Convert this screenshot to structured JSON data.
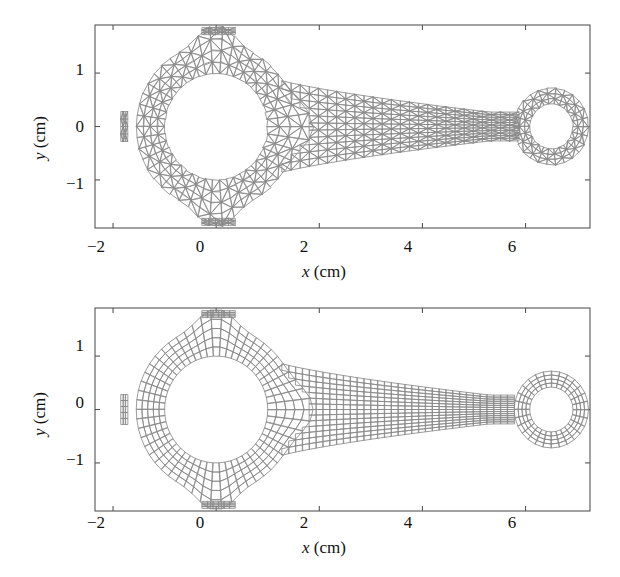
{
  "figure": {
    "background": "#ffffff",
    "mesh_color": "#8a8a8a",
    "axis_color": "#555555",
    "text_color": "#111111"
  },
  "chart_data": {
    "type": "diagram",
    "title": "",
    "panels": [
      {
        "id": "top",
        "mesh_type": "triangular",
        "xlabel": "x (cm)",
        "ylabel": "y (cm)",
        "xticks": [
          -2,
          0,
          2,
          4,
          6
        ],
        "xticklabels": [
          "−2",
          "0",
          "2",
          "4",
          "6"
        ],
        "yticks": [
          -1,
          0,
          1
        ],
        "yticklabels": [
          "−1",
          "0",
          "1"
        ],
        "xlim": [
          -2.35,
          7.25
        ],
        "ylim": [
          -1.9,
          1.9
        ],
        "grid": false,
        "box": true,
        "tick_direction": "in"
      },
      {
        "id": "bottom",
        "mesh_type": "quadrilateral",
        "xlabel": "x (cm)",
        "ylabel": "y (cm)",
        "xticks": [
          -2,
          0,
          2,
          4,
          6
        ],
        "xticklabels": [
          "−2",
          "0",
          "2",
          "4",
          "6"
        ],
        "yticks": [
          -1,
          0,
          1
        ],
        "yticklabels": [
          "−1",
          "0",
          "1"
        ],
        "xlim": [
          -2.35,
          7.25
        ],
        "ylim": [
          -1.9,
          1.9
        ],
        "grid": false,
        "box": true,
        "tick_direction": "in"
      }
    ],
    "geometry": {
      "big_end": {
        "center_x": 0.0,
        "center_y": 0.0,
        "inner_radius": 1.0,
        "outer_radius": 1.55
      },
      "small_end": {
        "center_x": 6.5,
        "center_y": 0.0,
        "inner_radius": 0.42,
        "outer_radius": 0.72
      },
      "shank_half_width_at_big_end": 0.95,
      "shank_half_width_at_small_end": 0.27,
      "tabs": [
        {
          "side": "top",
          "x_center": 0.05,
          "half_width": 0.32,
          "y_extent": 1.85
        },
        {
          "side": "bottom",
          "x_center": 0.05,
          "half_width": 0.32,
          "y_extent": -1.85
        },
        {
          "side": "left",
          "y_center": 0.0,
          "half_height": 0.28,
          "x_extent": -1.85
        }
      ]
    }
  }
}
